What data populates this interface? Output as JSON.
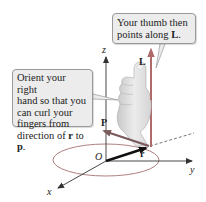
{
  "figure": {
    "callouts": {
      "top": {
        "line1": "Your thumb then",
        "line2_prefix": "points along ",
        "line2_bold": "L",
        "line2_suffix": "."
      },
      "left": {
        "line1": "Orient your right",
        "line2": "hand so that you",
        "line3": "can curl your",
        "line4": "fingers from",
        "line5_prefix": "direction of ",
        "line5_r": "r",
        "line5_mid": " to ",
        "line5_p": "p",
        "line5_suffix": "."
      }
    },
    "axes": {
      "x_label": "x",
      "y_label": "y",
      "z_label": "z",
      "origin_label": "O"
    },
    "vectors": {
      "r_label": "r",
      "p_label": "P",
      "L_label": "L"
    },
    "colors": {
      "callout_bg": "#ececec",
      "callout_border": "#9a9a9a",
      "vector_L": "#b06a6a",
      "vector_p": "#7a5a5a",
      "vector_r": "#111111",
      "axis": "#333333",
      "ellipse": "#b08080",
      "hand": "#e0e0e0"
    }
  }
}
